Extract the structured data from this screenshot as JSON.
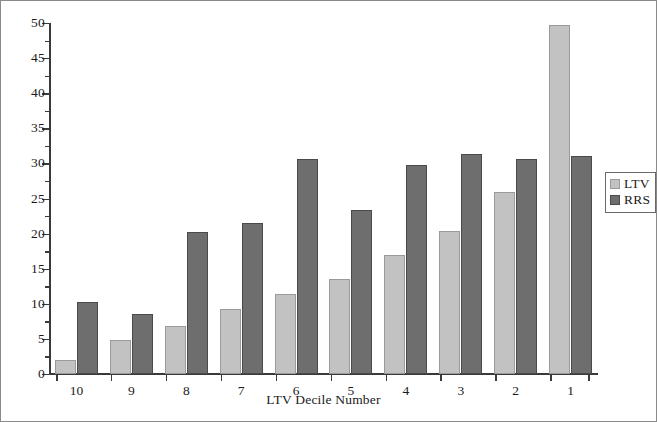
{
  "chart_data": {
    "type": "bar",
    "title": "",
    "xlabel": "LTV Decile Number",
    "ylabel": "",
    "categories": [
      "10",
      "9",
      "8",
      "7",
      "6",
      "5",
      "4",
      "3",
      "2",
      "1"
    ],
    "series": [
      {
        "name": "LTV",
        "color": "#c2c2c2",
        "values": [
          2.0,
          4.9,
          6.8,
          9.2,
          11.4,
          13.6,
          17.0,
          20.4,
          25.9,
          49.7
        ]
      },
      {
        "name": "RRS",
        "color": "#6e6e6e",
        "values": [
          10.2,
          8.6,
          20.3,
          21.5,
          30.7,
          23.3,
          29.8,
          31.3,
          30.6,
          31.1
        ]
      }
    ],
    "ylim": [
      0,
      50
    ],
    "yticks": [
      0,
      5,
      10,
      15,
      20,
      25,
      30,
      35,
      40,
      45,
      50
    ],
    "ytick_labels": [
      "0",
      "5",
      "10",
      "15",
      "20",
      "25",
      "30",
      "35",
      "40",
      "45",
      "50"
    ],
    "yminor_ticks": [
      2.5,
      7.5,
      12.5,
      17.5,
      22.5,
      27.5,
      32.5,
      37.5,
      42.5,
      47.5
    ],
    "grid": false,
    "legend": {
      "position": "right",
      "entries": [
        {
          "label": "LTV",
          "color": "#c2c2c2"
        },
        {
          "label": "RRS",
          "color": "#6e6e6e"
        }
      ]
    }
  },
  "figure": {
    "border_color": "#8a8a8a",
    "background": "#ffffff",
    "axis_color": "#3a3a3a"
  }
}
